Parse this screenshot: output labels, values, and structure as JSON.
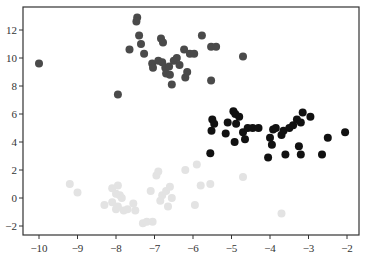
{
  "chart_data": {
    "type": "scatter",
    "title": "",
    "xlabel": "",
    "ylabel": "",
    "xlim": [
      -10.4,
      -1.7
    ],
    "ylim": [
      -2.6,
      13.6
    ],
    "grid": false,
    "legend": null,
    "xticks": [
      -10,
      -9,
      -8,
      -7,
      -6,
      -5,
      -4,
      -3,
      -2
    ],
    "xtick_labels": [
      "-10",
      "-9",
      "-8",
      "-7",
      "-6",
      "-5",
      "-4",
      "-3",
      "-2"
    ],
    "yticks": [
      -2,
      0,
      2,
      4,
      6,
      8,
      10,
      12
    ],
    "ytick_labels": [
      "-2",
      "0",
      "2",
      "4",
      "6",
      "8",
      "10",
      "12"
    ],
    "series": [
      {
        "name": "cluster-dark-gray",
        "color": "#4a4a4a",
        "points": [
          [
            -10.0,
            9.6
          ],
          [
            -7.95,
            7.4
          ],
          [
            -7.45,
            12.9
          ],
          [
            -7.47,
            12.6
          ],
          [
            -7.4,
            11.6
          ],
          [
            -7.35,
            11.0
          ],
          [
            -7.65,
            10.6
          ],
          [
            -7.27,
            10.3
          ],
          [
            -7.06,
            9.6
          ],
          [
            -7.04,
            9.3
          ],
          [
            -6.9,
            9.8
          ],
          [
            -6.8,
            9.7
          ],
          [
            -6.72,
            9.3
          ],
          [
            -6.7,
            8.9
          ],
          [
            -6.6,
            8.8
          ],
          [
            -6.83,
            11.4
          ],
          [
            -6.78,
            11.1
          ],
          [
            -6.5,
            9.8
          ],
          [
            -6.55,
            8.1
          ],
          [
            -6.23,
            10.6
          ],
          [
            -6.08,
            10.3
          ],
          [
            -5.97,
            10.3
          ],
          [
            -5.77,
            11.6
          ],
          [
            -5.53,
            10.8
          ],
          [
            -5.4,
            10.8
          ],
          [
            -5.53,
            8.4
          ],
          [
            -4.7,
            10.1
          ],
          [
            -6.2,
            8.6
          ],
          [
            -6.15,
            9.0
          ],
          [
            -6.35,
            9.5
          ],
          [
            -6.62,
            9.4
          ],
          [
            -6.42,
            10.0
          ]
        ]
      },
      {
        "name": "cluster-black",
        "color": "#111111",
        "points": [
          [
            -5.55,
            3.2
          ],
          [
            -5.5,
            5.6
          ],
          [
            -5.45,
            5.3
          ],
          [
            -5.52,
            4.8
          ],
          [
            -5.1,
            5.4
          ],
          [
            -5.15,
            4.6
          ],
          [
            -4.95,
            6.2
          ],
          [
            -4.9,
            6.0
          ],
          [
            -4.8,
            5.8
          ],
          [
            -4.88,
            5.3
          ],
          [
            -4.92,
            4.0
          ],
          [
            -4.7,
            4.7
          ],
          [
            -4.65,
            4.2
          ],
          [
            -4.58,
            5.0
          ],
          [
            -4.45,
            5.0
          ],
          [
            -4.3,
            5.0
          ],
          [
            -4.05,
            2.9
          ],
          [
            -4.0,
            4.3
          ],
          [
            -3.95,
            3.8
          ],
          [
            -3.92,
            4.9
          ],
          [
            -3.7,
            4.5
          ],
          [
            -3.65,
            4.8
          ],
          [
            -3.6,
            3.1
          ],
          [
            -3.5,
            5.0
          ],
          [
            -3.4,
            5.2
          ],
          [
            -3.3,
            5.6
          ],
          [
            -3.25,
            3.7
          ],
          [
            -3.2,
            3.1
          ],
          [
            -3.2,
            5.4
          ],
          [
            -3.15,
            6.1
          ],
          [
            -2.95,
            5.8
          ],
          [
            -2.65,
            3.1
          ],
          [
            -2.5,
            4.3
          ],
          [
            -2.05,
            4.7
          ],
          [
            -3.85,
            5.0
          ]
        ]
      },
      {
        "name": "cluster-light-gray",
        "color": "#e3e3e3",
        "points": [
          [
            -9.2,
            1.0
          ],
          [
            -9.0,
            0.4
          ],
          [
            -8.1,
            0.7
          ],
          [
            -7.95,
            0.9
          ],
          [
            -7.9,
            0.2
          ],
          [
            -8.0,
            0.3
          ],
          [
            -7.85,
            0.0
          ],
          [
            -8.3,
            -0.5
          ],
          [
            -8.1,
            -0.3
          ],
          [
            -8.0,
            -0.8
          ],
          [
            -7.95,
            -0.6
          ],
          [
            -7.8,
            -0.9
          ],
          [
            -7.7,
            -0.8
          ],
          [
            -7.55,
            -0.4
          ],
          [
            -7.5,
            -0.9
          ],
          [
            -7.3,
            -1.8
          ],
          [
            -7.2,
            -1.7
          ],
          [
            -7.05,
            -1.7
          ],
          [
            -7.1,
            0.5
          ],
          [
            -6.95,
            1.6
          ],
          [
            -6.9,
            1.9
          ],
          [
            -6.8,
            0.2
          ],
          [
            -6.85,
            -0.2
          ],
          [
            -6.7,
            0.5
          ],
          [
            -6.65,
            -0.6
          ],
          [
            -6.55,
            0.0
          ],
          [
            -6.2,
            2.0
          ],
          [
            -5.9,
            2.4
          ],
          [
            -5.55,
            1.0
          ],
          [
            -5.8,
            0.9
          ],
          [
            -5.95,
            -0.5
          ],
          [
            -4.7,
            1.5
          ],
          [
            -3.7,
            -1.1
          ],
          [
            -6.6,
            0.8
          ]
        ]
      }
    ]
  }
}
